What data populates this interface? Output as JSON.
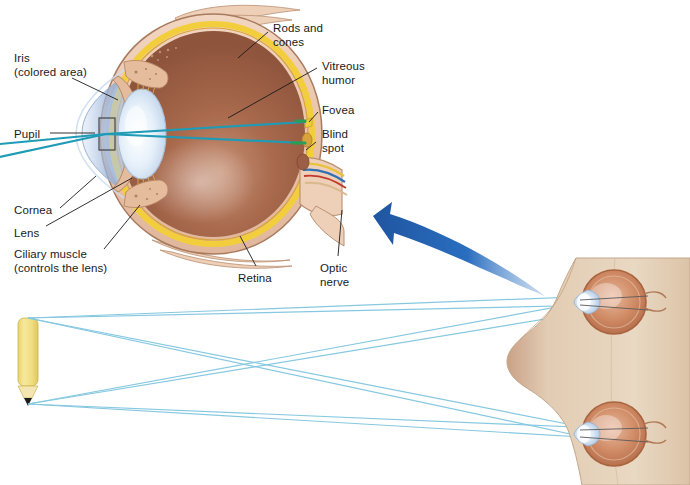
{
  "figure": {
    "type": "anatomical-diagram"
  },
  "eye_diagram": {
    "labels": [
      {
        "id": "iris",
        "text": "Iris\n(colored area)",
        "x": 14,
        "y": 52
      },
      {
        "id": "pupil",
        "text": "Pupil",
        "x": 14,
        "y": 128
      },
      {
        "id": "cornea",
        "text": "Cornea",
        "x": 14,
        "y": 204
      },
      {
        "id": "lens",
        "text": "Lens",
        "x": 14,
        "y": 227
      },
      {
        "id": "ciliary-muscle",
        "text": "Ciliary muscle\n(controls the lens)",
        "x": 14,
        "y": 248
      },
      {
        "id": "retina",
        "text": "Retina",
        "x": 238,
        "y": 272
      },
      {
        "id": "rods-and-cones",
        "text": "Rods and\ncones",
        "x": 273,
        "y": 22
      },
      {
        "id": "vitreous-humor",
        "text": "Vitreous\nhumor",
        "x": 322,
        "y": 60
      },
      {
        "id": "fovea",
        "text": "Fovea",
        "x": 322,
        "y": 104
      },
      {
        "id": "blind-spot",
        "text": "Blind\nspot",
        "x": 322,
        "y": 128
      },
      {
        "id": "optic-nerve",
        "text": "Optic\nnerve",
        "x": 320,
        "y": 262
      }
    ],
    "colors": {
      "sclera": "#eac4ab",
      "choroid_yellow": "#f5d13f",
      "vitreous": "#9c5e45",
      "cornea_blue": "#b9cce8",
      "lens": "#dce8f5",
      "ciliary_muscle": "#e2b394",
      "light_ray": "#1f9bb5",
      "retina_mark": "#2a9d57",
      "outline": "#8a6a52"
    }
  },
  "scene": {
    "arrow": {
      "id": "magnify-arrow",
      "color": "#2463ad",
      "direction": "up-left"
    },
    "pencil": {
      "id": "pencil-object",
      "body_color": "#f2e07a",
      "tip_color": "#1c1c1c"
    },
    "head": {
      "id": "head-cross-section",
      "skin_color": "#e3cdb4",
      "eyes": [
        {
          "id": "head-eye-upper",
          "iris_color": "#c97b52"
        },
        {
          "id": "head-eye-lower",
          "iris_color": "#c97b52"
        }
      ]
    },
    "light_rays": {
      "color": "#86c8e0",
      "count": 8
    }
  }
}
